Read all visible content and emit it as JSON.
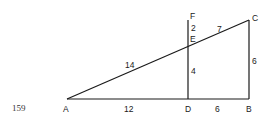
{
  "figure": {
    "number": "159",
    "points": {
      "A": "A",
      "B": "B",
      "C": "C",
      "D": "D",
      "E": "E",
      "F": "F"
    },
    "lengths": {
      "AE": "14",
      "EC": "7",
      "FE": "2",
      "ED": "4",
      "CB": "6",
      "AD": "12",
      "DB": "6"
    }
  }
}
